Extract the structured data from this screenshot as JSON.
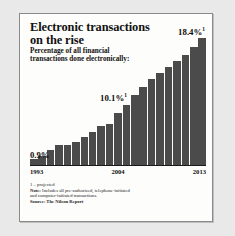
{
  "figure": {
    "title": "Electronic transactions on the rise",
    "subtitle": "Percentage of all financial transactions done electronically:",
    "callouts": {
      "first": "0.9%",
      "middle": "10.1%",
      "middle_sup": "1",
      "last": "18.4%",
      "last_sup": "1"
    },
    "footnotes": {
      "projected": "1 – projected",
      "note_label": "Note:",
      "note_line1": " Includes all pre-authorized, telephone-initiated",
      "note_line2": "and computer-initiated transactions.",
      "source_label": "Source:",
      "source_value": " The Nilson Report"
    },
    "colors": {
      "bar": "#4b4b4b",
      "axis": "#1a1a1a",
      "paper": "#fdfdfb",
      "frame": "#8a8a8a",
      "page": "#e9e9e9"
    }
  },
  "chart_data": {
    "type": "bar",
    "title": "Electronic transactions on the rise",
    "subtitle": "Percentage of all financial transactions done electronically:",
    "xlabel": "",
    "ylabel": "Percentage of all financial transactions done electronically",
    "ylim": [
      0,
      18.4
    ],
    "grid": false,
    "legend": null,
    "tick_labels": [
      "1993",
      "2004",
      "2013"
    ],
    "categories": [
      "1993",
      "1994",
      "1995",
      "1996",
      "1997",
      "1998",
      "1999",
      "2000",
      "2001",
      "2002",
      "2003",
      "2004",
      "2005",
      "2006",
      "2007",
      "2008",
      "2009",
      "2010",
      "2011",
      "2012",
      "2013"
    ],
    "values": [
      0.9,
      1.3,
      2.2,
      2.9,
      2.9,
      3.4,
      4.1,
      4.8,
      5.6,
      6.0,
      7.6,
      8.7,
      10.1,
      11.3,
      12.4,
      13.3,
      14.2,
      15.1,
      15.9,
      17.1,
      18.4
    ],
    "annotations": [
      {
        "category": "1993",
        "text": "0.9%"
      },
      {
        "category": "2005",
        "text": "10.1%¹"
      },
      {
        "category": "2013",
        "text": "18.4%¹"
      }
    ],
    "notes": [
      "1 – projected",
      "Note: Includes all pre-authorized, telephone-initiated and computer-initiated transactions.",
      "Source: The Nilson Report"
    ]
  }
}
